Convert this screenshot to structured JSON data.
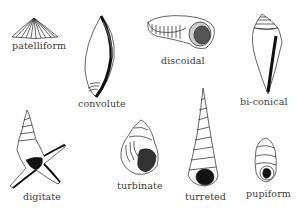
{
  "figure": {
    "title": "",
    "shell_shapes": [
      {
        "id": "patelliform",
        "label": "patelliform"
      },
      {
        "id": "convolute",
        "label": "convolute"
      },
      {
        "id": "discoidal",
        "label": "discoidal"
      },
      {
        "id": "bi-conical",
        "label": "bi-conical"
      },
      {
        "id": "digitate",
        "label": "digitate"
      },
      {
        "id": "turbinate",
        "label": "turbinate"
      },
      {
        "id": "turreted",
        "label": "turreted"
      },
      {
        "id": "pupiform",
        "label": "pupiform"
      }
    ]
  }
}
